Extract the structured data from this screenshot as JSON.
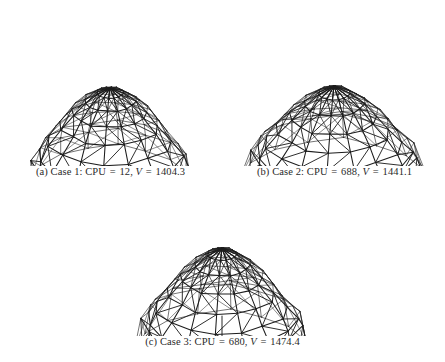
{
  "figure": {
    "type": "multi-panel-wireframe",
    "background": "#ffffff",
    "line_color": "#1c1c1c",
    "panels": [
      {
        "id": "panel-a",
        "label": "(a)",
        "case_name": "Case 1",
        "cpu_label": "CPU",
        "cpu_value": "12",
        "volume_label": "V",
        "volume_value": "1404.3",
        "caption": "(a) Case 1: CPU = 12, V = 1404.3",
        "box": {
          "x": 4,
          "y": 26,
          "w": 213,
          "h": 140
        },
        "caption_box": {
          "x": 4,
          "y": 166,
          "w": 213
        },
        "structure": {
          "rings": 7,
          "sectors": 16,
          "center_x": 106,
          "center_y": 62,
          "base_y": 138,
          "radius_x": 78,
          "radius_y": 34,
          "apex_rise": 0.0,
          "profile_r": [
            0.0,
            0.17,
            0.33,
            0.49,
            0.64,
            0.8,
            0.93,
            1.0
          ],
          "profile_z": [
            0.0,
            0.06,
            0.16,
            0.3,
            0.47,
            0.66,
            0.85,
            1.0
          ],
          "skirt_drop": 20,
          "flare": 0.0,
          "bracing": "diagonal-alternating"
        }
      },
      {
        "id": "panel-b",
        "label": "(b)",
        "case_name": "Case 2",
        "cpu_label": "CPU",
        "cpu_value": "688",
        "volume_label": "V",
        "volume_value": "1441.1",
        "caption": "(b) Case 2: CPU = 688, V = 1441.1",
        "box": {
          "x": 228,
          "y": 26,
          "w": 213,
          "h": 140
        },
        "caption_box": {
          "x": 228,
          "y": 166,
          "w": 213
        },
        "structure": {
          "rings": 7,
          "sectors": 16,
          "center_x": 106,
          "center_y": 60,
          "base_y": 128,
          "radius_x": 82,
          "radius_y": 38,
          "apex_rise": 0.0,
          "profile_r": [
            0.0,
            0.19,
            0.37,
            0.54,
            0.7,
            0.84,
            0.95,
            1.0
          ],
          "profile_z": [
            0.0,
            0.1,
            0.24,
            0.42,
            0.6,
            0.78,
            0.92,
            1.0
          ],
          "skirt_drop": 30,
          "flare": 0.14,
          "bracing": "diagonal-alternating"
        }
      },
      {
        "id": "panel-c",
        "label": "(c)",
        "case_name": "Case 3",
        "cpu_label": "CPU",
        "cpu_value": "680",
        "volume_label": "V",
        "volume_value": "1474.4",
        "caption": "(c) Case 3: CPU = 680, V = 1474.4",
        "box": {
          "x": 116,
          "y": 196,
          "w": 213,
          "h": 140
        },
        "caption_box": {
          "x": 116,
          "y": 336,
          "w": 213
        },
        "structure": {
          "rings": 7,
          "sectors": 16,
          "center_x": 106,
          "center_y": 52,
          "base_y": 126,
          "radius_x": 80,
          "radius_y": 36,
          "apex_rise": 0.0,
          "profile_r": [
            0.0,
            0.18,
            0.35,
            0.52,
            0.68,
            0.83,
            0.94,
            1.0
          ],
          "profile_z": [
            0.0,
            0.08,
            0.21,
            0.38,
            0.57,
            0.76,
            0.91,
            1.0
          ],
          "skirt_drop": 32,
          "flare": 0.08,
          "bracing": "diagonal-alternating",
          "center_post": true
        }
      }
    ]
  }
}
